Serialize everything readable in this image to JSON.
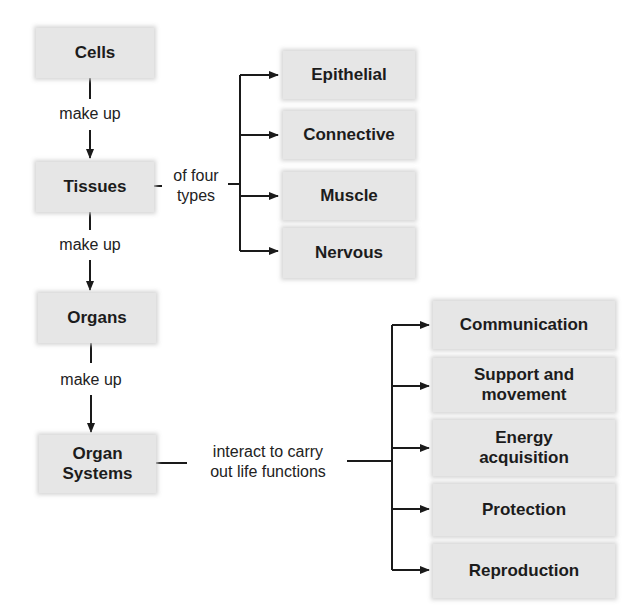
{
  "hierarchy": {
    "levels": [
      {
        "label": "Cells"
      },
      {
        "label": "Tissues"
      },
      {
        "label": "Organs"
      },
      {
        "label": "Organ Systems",
        "line1": "Organ",
        "line2": "Systems"
      }
    ],
    "connectors": [
      {
        "label": "make up"
      },
      {
        "label": "make up"
      },
      {
        "label": "make up"
      }
    ]
  },
  "tissue_types": {
    "connector_line1": "of four",
    "connector_line2": "types",
    "items": [
      {
        "label": "Epithelial"
      },
      {
        "label": "Connective"
      },
      {
        "label": "Muscle"
      },
      {
        "label": "Nervous"
      }
    ]
  },
  "life_functions": {
    "connector_line1": "interact to carry",
    "connector_line2": "out life functions",
    "items": [
      {
        "label": "Communication"
      },
      {
        "line1": "Support and",
        "line2": "movement"
      },
      {
        "line1": "Energy",
        "line2": "acquisition"
      },
      {
        "label": "Protection"
      },
      {
        "label": "Reproduction"
      }
    ]
  }
}
